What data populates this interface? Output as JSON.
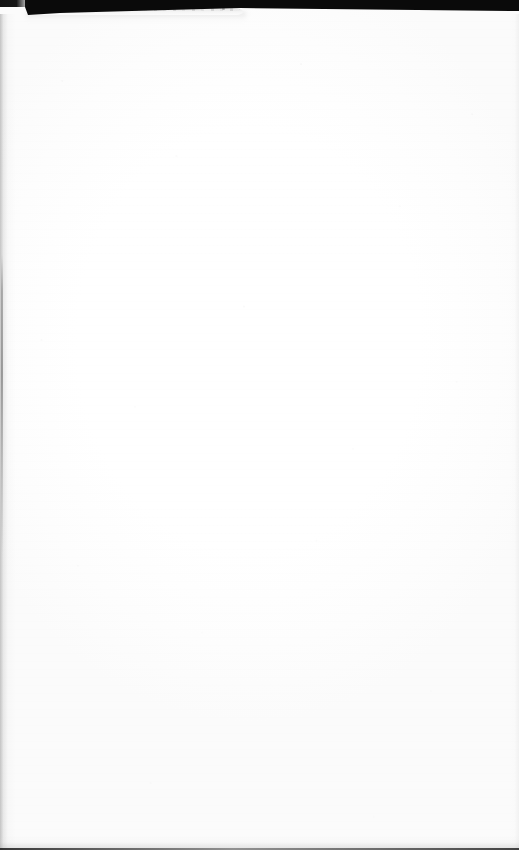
{
  "document": {
    "kind": "scanned-page",
    "page_content_text": "",
    "is_blank": true,
    "width_px": 519,
    "height_px": 850,
    "background_color": "#ffffff",
    "artifacts": {
      "scanner_lid_band": {
        "name": "scanner-lid-band",
        "color": "#0a0a0a",
        "position": "top",
        "height_px": 16
      },
      "lifted_page_edge": {
        "name": "lifted-page-edge",
        "color": "#d8d8d8",
        "position": "top-left",
        "start_x_px": 28,
        "width_px": 215
      },
      "left_margin_shadow": {
        "name": "left-margin-shadow",
        "color": "#969696",
        "position": "left"
      },
      "bottom_edge_line": {
        "name": "bottom-edge-line",
        "color": "#1e1e1e",
        "position": "bottom",
        "height_px": 2
      },
      "right_margin_shadow": {
        "name": "right-margin-shadow",
        "color": "#d7d7d7",
        "position": "right"
      },
      "paper_grain": {
        "name": "paper-grain",
        "color": "#bebebe"
      }
    }
  }
}
